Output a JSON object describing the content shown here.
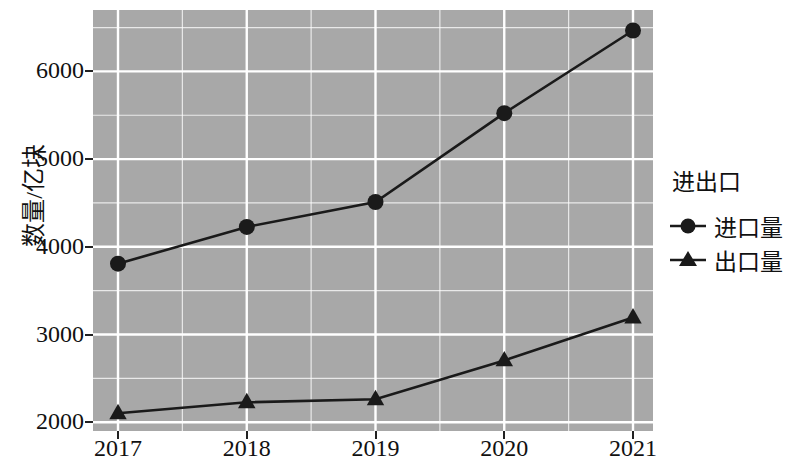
{
  "chart_data": {
    "type": "line",
    "title": "",
    "xlabel": "",
    "ylabel": "数量/亿块",
    "categories": [
      "2017",
      "2018",
      "2019",
      "2020",
      "2021"
    ],
    "x_tick_labels": [
      "2017",
      "2018",
      "2019",
      "2020",
      "2021"
    ],
    "y_tick_labels": [
      "2000",
      "3000",
      "4000",
      "5000",
      "6000"
    ],
    "y_ticks": [
      2000,
      3000,
      4000,
      5000,
      6000
    ],
    "ylim": [
      1900,
      6700
    ],
    "xlim": [
      "2016.6",
      "2021.4"
    ],
    "grid": true,
    "legend_position": "right",
    "legend_title": "进出口",
    "panel_background": "#a8a8a8",
    "grid_color": "#ffffff",
    "line_color": "#1a1a1a",
    "series": [
      {
        "name": "进口量",
        "marker": "circle",
        "values": [
          3807,
          4227,
          4511,
          5523,
          6466
        ]
      },
      {
        "name": "出口量",
        "marker": "triangle",
        "values": [
          2102,
          2227,
          2261,
          2705,
          3193
        ]
      }
    ]
  },
  "legend": {
    "title": "进出口",
    "entries": [
      {
        "label": "进口量",
        "marker": "circle-marker-icon"
      },
      {
        "label": "出口量",
        "marker": "triangle-marker-icon"
      }
    ]
  },
  "axes": {
    "y_title": "数量/亿块",
    "y_labels": [
      "6000",
      "5000",
      "4000",
      "3000",
      "2000"
    ],
    "x_labels": [
      "2017",
      "2018",
      "2019",
      "2020",
      "2021"
    ]
  }
}
